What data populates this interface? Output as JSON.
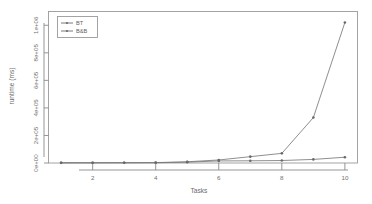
{
  "chart_data": {
    "type": "line",
    "title": "",
    "xlabel": "Tasks",
    "ylabel": "runtime (ms)",
    "x": [
      1,
      2,
      3,
      4,
      5,
      6,
      7,
      8,
      9,
      10
    ],
    "xlim": [
      0.6,
      10.4
    ],
    "ylim": [
      0,
      1100000
    ],
    "xticks": [
      2,
      4,
      6,
      8,
      10
    ],
    "xticklabels": [
      "2",
      "4",
      "6",
      "8",
      "10"
    ],
    "yticks": [
      0,
      200000,
      400000,
      600000,
      800000,
      1000000
    ],
    "yticklabels": [
      "0e+00",
      "2e+05",
      "4e+05",
      "6e+05",
      "8e+05",
      "1e+06"
    ],
    "grid": false,
    "legend_position": "top-left",
    "series": [
      {
        "name": "BT",
        "marker": "point",
        "values": [
          1500,
          1800,
          2200,
          3000,
          9000,
          22000,
          46000,
          70000,
          330000,
          1020000
        ]
      },
      {
        "name": "B&B",
        "marker": "point",
        "values": [
          1200,
          1400,
          1600,
          2000,
          6000,
          15000,
          16000,
          18000,
          26000,
          42000
        ]
      }
    ]
  },
  "legend": {
    "entries": [
      "BT",
      "B&B"
    ]
  },
  "axes": {
    "x_title": "Tasks",
    "y_title": "runtime (ms)"
  }
}
